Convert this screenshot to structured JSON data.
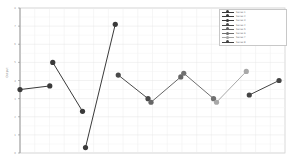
{
  "chart_data": {
    "type": "line",
    "title": "",
    "xlabel": "",
    "ylabel": "Output",
    "ylim": [
      0,
      8
    ],
    "grid": true,
    "legend_position": "upper right",
    "series": [
      {
        "name": "Series 1",
        "color": "#3a3a3a",
        "points": [
          [
            0,
            3.5
          ],
          [
            1,
            3.7
          ]
        ]
      },
      {
        "name": "Series 2",
        "color": "#3a3a3a",
        "points": [
          [
            1.1,
            5.0
          ],
          [
            2.1,
            2.3
          ]
        ]
      },
      {
        "name": "Series 3",
        "color": "#3a3a3a",
        "points": [
          [
            2.2,
            0.3
          ],
          [
            3.2,
            7.1
          ]
        ]
      },
      {
        "name": "Series 4",
        "color": "#4a4a4a",
        "points": [
          [
            3.3,
            4.3
          ],
          [
            4.3,
            3.0
          ]
        ]
      },
      {
        "name": "Series 5",
        "color": "#666666",
        "points": [
          [
            4.4,
            2.8
          ],
          [
            5.4,
            4.2
          ]
        ]
      },
      {
        "name": "Series 6",
        "color": "#707070",
        "points": [
          [
            5.5,
            4.4
          ],
          [
            6.5,
            3.0
          ]
        ]
      },
      {
        "name": "Series 7",
        "color": "#a8a8a8",
        "points": [
          [
            6.6,
            2.8
          ],
          [
            7.6,
            4.5
          ]
        ]
      },
      {
        "name": "Series 8",
        "color": "#444444",
        "points": [
          [
            7.7,
            3.2
          ],
          [
            8.7,
            4.0
          ]
        ]
      }
    ]
  },
  "legend": {
    "items": [
      {
        "label": "Series 1",
        "color": "#3a3a3a"
      },
      {
        "label": "Series 2",
        "color": "#3a3a3a"
      },
      {
        "label": "Series 3",
        "color": "#3a3a3a"
      },
      {
        "label": "Series 4",
        "color": "#4a4a4a"
      },
      {
        "label": "Series 5",
        "color": "#666666"
      },
      {
        "label": "Series 6",
        "color": "#707070"
      },
      {
        "label": "Series 7",
        "color": "#a8a8a8"
      },
      {
        "label": "Series 8",
        "color": "#444444"
      }
    ]
  },
  "axis": {
    "ylabel": "Output"
  }
}
